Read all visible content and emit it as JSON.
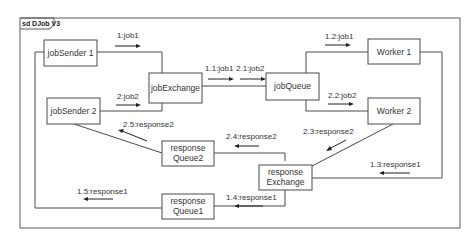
{
  "frame": {
    "title": "sd DJob V3"
  },
  "nodes": {
    "jobSender1": "jobSender 1",
    "jobSender2": "jobSender 2",
    "jobExchange": "jobExchange",
    "jobQueue": "jobQueue",
    "worker1": "Worker 1",
    "worker2": "Worker 2",
    "responseQueue2_l1": "response",
    "responseQueue2_l2": "Queue2",
    "responseExchange_l1": "response",
    "responseExchange_l2": "Exchange",
    "responseQueue1_l1": "response",
    "responseQueue1_l2": "Queue1"
  },
  "messages": {
    "m1": "1:job1",
    "m2": "2:job2",
    "m11": "1.1:job1",
    "m21": "2.1:job2",
    "m12": "1.2:job1",
    "m22": "2.2:job2",
    "m23": "2.3:response2",
    "m24": "2.4:response2",
    "m25": "2.5:response2",
    "m13": "1.3:response1",
    "m14": "1.4:response1",
    "m15": "1.5:response1"
  }
}
